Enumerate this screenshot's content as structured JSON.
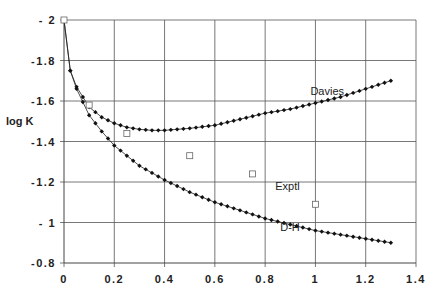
{
  "chart_data": {
    "type": "line",
    "title": "",
    "xlabel": "",
    "ylabel": "log K",
    "xlim": [
      0,
      1.4
    ],
    "ylim": [
      -2,
      -0.8
    ],
    "y_inverted": true,
    "grid": true,
    "x_ticks": [
      "0",
      "0.2",
      "0.4",
      "0.6",
      "0.8",
      "1",
      "1.2",
      "1.4"
    ],
    "y_ticks": [
      "- 2",
      "-1.8",
      "-1.6",
      "-1.4",
      "-1.2",
      "- 1",
      "-0.8"
    ],
    "series": [
      {
        "name": "Davies",
        "marker": "filled-diamond",
        "x": [
          0,
          0.025,
          0.05,
          0.1,
          0.15,
          0.2,
          0.25,
          0.3,
          0.35,
          0.4,
          0.5,
          0.6,
          0.7,
          0.8,
          0.9,
          1.0,
          1.1,
          1.2,
          1.3
        ],
        "values": [
          -2.0,
          -1.75,
          -1.67,
          -1.57,
          -1.52,
          -1.49,
          -1.47,
          -1.46,
          -1.455,
          -1.455,
          -1.465,
          -1.48,
          -1.51,
          -1.54,
          -1.56,
          -1.59,
          -1.62,
          -1.66,
          -1.7
        ]
      },
      {
        "name": "D-H",
        "marker": "filled-diamond",
        "x": [
          0,
          0.025,
          0.05,
          0.1,
          0.15,
          0.2,
          0.25,
          0.3,
          0.4,
          0.5,
          0.6,
          0.7,
          0.8,
          0.9,
          1.0,
          1.1,
          1.2,
          1.3
        ],
        "values": [
          -2.0,
          -1.75,
          -1.66,
          -1.53,
          -1.45,
          -1.38,
          -1.33,
          -1.28,
          -1.21,
          -1.15,
          -1.1,
          -1.06,
          -1.02,
          -0.99,
          -0.96,
          -0.94,
          -0.92,
          -0.9
        ]
      },
      {
        "name": "Exptl",
        "marker": "open-square",
        "x": [
          0,
          0.1,
          0.25,
          0.5,
          0.75,
          1.0
        ],
        "values": [
          -2.0,
          -1.58,
          -1.44,
          -1.33,
          -1.24,
          -1.09
        ]
      }
    ],
    "annotations": [
      {
        "text": "Davies",
        "x": 0.98,
        "y": -1.63
      },
      {
        "text": "Exptl",
        "x": 0.84,
        "y": -1.16
      },
      {
        "text": "D-H",
        "x": 0.86,
        "y": -0.96
      }
    ],
    "legend": "none (inline labels)"
  }
}
